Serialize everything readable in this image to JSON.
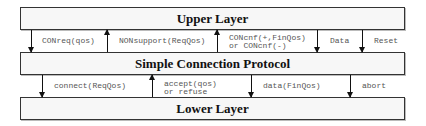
{
  "layers": {
    "upper": "Upper Layer",
    "middle": "Simple Connection Protocol",
    "lower": "Lower Layer"
  },
  "upper_interface": [
    {
      "label": "CONreq(qos)",
      "direction": "down"
    },
    {
      "label": "NONsupport(ReqQos)",
      "direction": "up"
    },
    {
      "label": "CONcnf(+,FinQos)",
      "label2": "or CONcnf(-)",
      "direction": "up"
    },
    {
      "label": "Data",
      "direction": "down"
    },
    {
      "label": "Reset",
      "direction": "down"
    }
  ],
  "lower_interface": [
    {
      "label": "connect(ReqQos)",
      "direction": "down"
    },
    {
      "label": "accept(qos)",
      "label2": "or refuse",
      "direction": "up"
    },
    {
      "label": "data(FinQos)",
      "direction": "down"
    },
    {
      "label": "abort",
      "direction": "down"
    }
  ]
}
